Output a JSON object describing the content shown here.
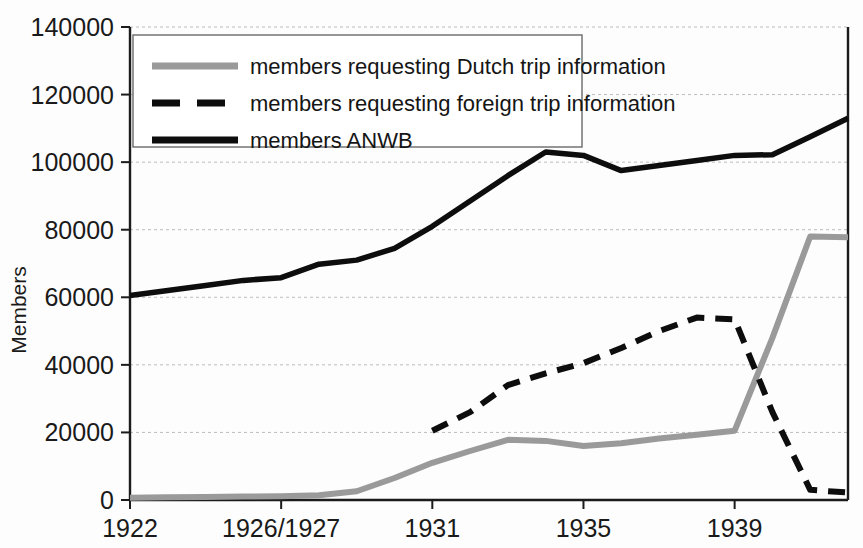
{
  "chart_data": {
    "type": "line",
    "title": "",
    "xlabel": "",
    "ylabel": "Members",
    "ylim": [
      0,
      140000
    ],
    "ytick_values": [
      0,
      20000,
      40000,
      60000,
      80000,
      100000,
      120000,
      140000
    ],
    "ytick_labels": [
      "0",
      "20000",
      "40000",
      "60000",
      "80000",
      "100000",
      "120000",
      "140000"
    ],
    "x": [
      1922,
      1923,
      1924,
      1925,
      "1926/1927",
      1928,
      1929,
      1930,
      1931,
      1932,
      1933,
      1934,
      1935,
      1936,
      1937,
      1938,
      1939,
      1940,
      1941,
      1942
    ],
    "xtick_labels": [
      "1922",
      "1926/1927",
      "1931",
      "1935",
      "1939"
    ],
    "xtick_positions": [
      1922,
      "1926/1927",
      1931,
      1935,
      1939
    ],
    "grid": true,
    "legend_position": "upper left",
    "series": [
      {
        "name": "members requesting Dutch trip information",
        "style": "solid",
        "color": "#9a9a9a",
        "values": [
          700,
          800,
          900,
          1000,
          1100,
          1400,
          2600,
          6500,
          11000,
          14500,
          17800,
          17500,
          16000,
          16800,
          18200,
          19300,
          20500,
          48000,
          78000,
          77800
        ]
      },
      {
        "name": "members requesting foreign trip information",
        "style": "dashed",
        "color": "#0d0d0d",
        "values": [
          null,
          null,
          null,
          null,
          null,
          null,
          null,
          null,
          20500,
          26000,
          34000,
          37500,
          40500,
          45000,
          50000,
          54000,
          53500,
          26000,
          3000,
          2200
        ]
      },
      {
        "name": "members ANWB",
        "style": "solid",
        "color": "#0d0d0d",
        "values": [
          60500,
          62000,
          63500,
          65000,
          65800,
          69800,
          71000,
          74500,
          81000,
          88500,
          96000,
          103000,
          102000,
          97500,
          99000,
          100500,
          102000,
          102200,
          107500,
          113000
        ]
      }
    ]
  },
  "axes": {
    "y_axis_title": "Members"
  },
  "legend": {
    "entries": [
      {
        "label": "members requesting Dutch trip information",
        "swatch": "gray-solid-line"
      },
      {
        "label": "members requesting foreign trip information",
        "swatch": "black-dashed-line"
      },
      {
        "label": "members ANWB",
        "swatch": "black-solid-line"
      }
    ]
  },
  "colors": {
    "gray_series": "#9a9a9a",
    "black_series": "#0d0d0d",
    "grid": "#bcbcbc",
    "axis": "#1b1b1b"
  }
}
